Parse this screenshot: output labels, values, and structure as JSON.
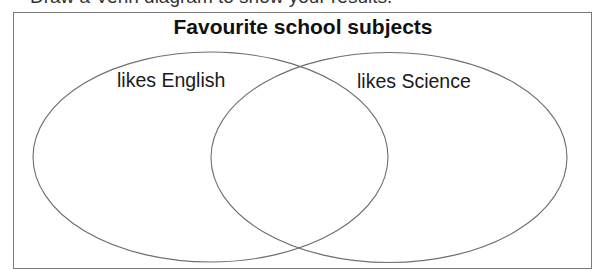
{
  "instruction": {
    "text": "Draw a Venn diagram to show your results.",
    "clipped": true
  },
  "diagram": {
    "title": "Favourite school subjects",
    "sets": [
      {
        "label": "likes English",
        "cx": 210.5,
        "cy": 157,
        "rx": 177.5,
        "ry": 105
      },
      {
        "label": "likes Science",
        "cx": 389,
        "cy": 157.5,
        "rx": 178,
        "ry": 105
      }
    ],
    "stroke_color": "#6e6e6e",
    "frame_color": "#7a7a7a"
  }
}
